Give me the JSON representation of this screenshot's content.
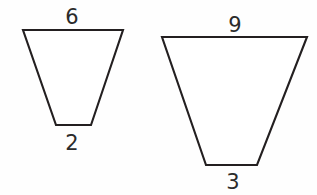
{
  "figure": {
    "canvas": {
      "width": 317,
      "height": 195,
      "background": "#fefefe"
    },
    "stroke_color": "#231f20",
    "label_color": "#2b2b2b",
    "shapes": [
      {
        "name": "small-trapezoid",
        "points": "23,30 123,30 91,125 56,125",
        "top_label": "6",
        "top_label_x": 72,
        "top_label_y": 24,
        "bottom_label": "2",
        "bottom_label_x": 72,
        "bottom_label_y": 150
      },
      {
        "name": "large-trapezoid",
        "points": "162,37 307,37 257,165 206,165",
        "top_label": "9",
        "top_label_x": 235,
        "top_label_y": 32,
        "bottom_label": "3",
        "bottom_label_x": 233,
        "bottom_label_y": 189
      }
    ]
  }
}
